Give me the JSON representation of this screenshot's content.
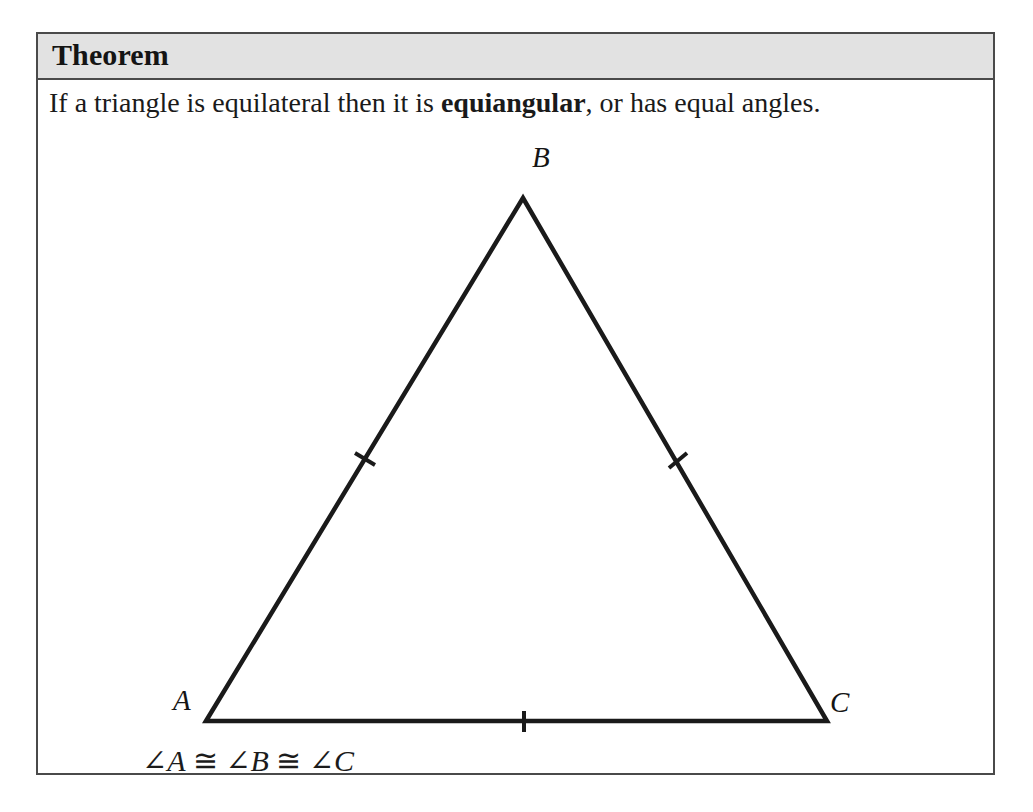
{
  "theorem": {
    "title": "Theorem",
    "statement_pre": "If a triangle is equilateral then it is ",
    "statement_bold": "equiangular",
    "statement_post": ", or has equal angles."
  },
  "figure": {
    "type": "equilateral-triangle-diagram",
    "vertex_labels": {
      "top": "B",
      "bottom_left": "A",
      "bottom_right": "C"
    },
    "tick_marks": {
      "count": 3,
      "sides": [
        "AB",
        "BC",
        "AC"
      ],
      "meaning": "congruent-sides"
    },
    "caption": {
      "angle_symbol": "∠",
      "congruent_symbol": "≅",
      "a": "A",
      "b": "B",
      "c": "C",
      "full": "∠A ≅ ∠B ≅ ∠C"
    }
  },
  "colors": {
    "header_band": "#dedede",
    "border": "#4a4a4a",
    "ink": "#1a1a1a",
    "page": "#ffffff"
  }
}
